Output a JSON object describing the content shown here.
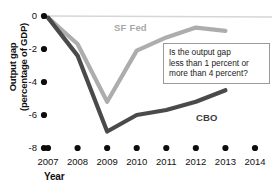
{
  "chart_data": {
    "type": "line",
    "title": "",
    "xlabel": "Year",
    "ylabel": "Output gap\n(percentage of GDP)",
    "x": [
      2007,
      2008,
      2009,
      2010,
      2011,
      2012,
      2013,
      2014
    ],
    "xtick_labels": [
      "2007",
      "2008",
      "2009",
      "2010",
      "2011",
      "2012",
      "2013",
      "2014"
    ],
    "ytick_labels": [
      "0",
      "-2",
      "-4",
      "-6",
      "-8"
    ],
    "ytick_values": [
      0,
      -2,
      -4,
      -6,
      -8
    ],
    "xlim": [
      2007,
      2014
    ],
    "ylim": [
      -8,
      0
    ],
    "grid": "zero-line-only",
    "legend_position": "inline-annotations",
    "series": [
      {
        "name": "SF Fed",
        "color": "#adadad",
        "x": [
          2007,
          2008,
          2009,
          2010,
          2011,
          2012,
          2013
        ],
        "values": [
          -0.1,
          -1.7,
          -5.2,
          -2.1,
          -1.3,
          -0.7,
          -0.9
        ]
      },
      {
        "name": "CBO",
        "color": "#4a4a4a",
        "x": [
          2007,
          2008,
          2009,
          2010,
          2011,
          2012,
          2013
        ],
        "values": [
          -0.1,
          -2.4,
          -7.0,
          -6.0,
          -5.7,
          -5.2,
          -4.5
        ]
      }
    ],
    "annotations": [
      {
        "name": "question-callout",
        "text": "Is the output gap\nless than 1 percent or\nmore than 4 percent?"
      }
    ]
  },
  "labels": {
    "y_axis_title": "Output gap\n(percentage of GDP)",
    "x_axis_title": "Year",
    "series_sf_fed": "SF Fed",
    "series_cbo": "CBO",
    "callout": "Is the output gap\nless than 1 percent or\nmore than 4 percent?"
  },
  "colors": {
    "sf_fed": "#adadad",
    "cbo": "#4a4a4a",
    "zero_line": "#d6d6d6",
    "tick_dot": "#0d0d0d",
    "callout_border": "#9a9a9a"
  }
}
